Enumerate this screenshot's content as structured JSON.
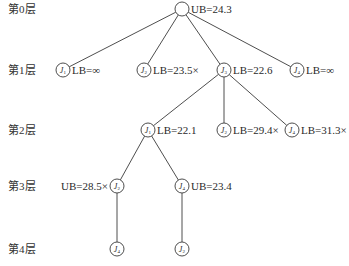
{
  "layers": [
    {
      "label": "第0层",
      "y": 9
    },
    {
      "label": "第1层",
      "y": 70
    },
    {
      "label": "第2层",
      "y": 130
    },
    {
      "label": "第3层",
      "y": 186
    },
    {
      "label": "第4层",
      "y": 249
    }
  ],
  "node_radius": 7,
  "colors": {
    "line": "#3a3a3a",
    "circle_stroke": "#3a3a3a",
    "text": "#2a2a2a",
    "background": "#ffffff"
  },
  "nodes": [
    {
      "id": "root",
      "job": "",
      "sub": "",
      "x": 182,
      "y": 9,
      "label": "UB=24.3",
      "label_side": "right",
      "pruned": false
    },
    {
      "id": "l1-j1",
      "job": "J",
      "sub": "1",
      "x": 63,
      "y": 70,
      "label": "LB=∞",
      "label_side": "right",
      "pruned": false
    },
    {
      "id": "l1-j2",
      "job": "J",
      "sub": "2",
      "x": 144,
      "y": 70,
      "label": "LB=23.5×",
      "label_side": "right",
      "pruned": true
    },
    {
      "id": "l1-j3",
      "job": "J",
      "sub": "3",
      "x": 224,
      "y": 70,
      "label": "LB=22.6",
      "label_side": "right",
      "pruned": false
    },
    {
      "id": "l1-j4",
      "job": "J",
      "sub": "4",
      "x": 297,
      "y": 70,
      "label": "LB=∞",
      "label_side": "right",
      "pruned": false
    },
    {
      "id": "l2-j1",
      "job": "J",
      "sub": "1",
      "x": 148,
      "y": 130,
      "label": "LB=22.1",
      "label_side": "right",
      "pruned": false
    },
    {
      "id": "l2-j2",
      "job": "J",
      "sub": "2",
      "x": 224,
      "y": 130,
      "label": "LB=29.4×",
      "label_side": "right",
      "pruned": true
    },
    {
      "id": "l2-j4",
      "job": "J",
      "sub": "4",
      "x": 292,
      "y": 130,
      "label": "LB=31.3×",
      "label_side": "right",
      "pruned": true
    },
    {
      "id": "l3-j2",
      "job": "J",
      "sub": "2",
      "x": 117,
      "y": 186,
      "label": "UB=28.5×",
      "label_side": "left",
      "pruned": true
    },
    {
      "id": "l3-j4",
      "job": "J",
      "sub": "4",
      "x": 182,
      "y": 186,
      "label": "UB=23.4",
      "label_side": "right",
      "pruned": false
    },
    {
      "id": "l4-j4",
      "job": "J",
      "sub": "4",
      "x": 117,
      "y": 249,
      "label": "",
      "label_side": "right",
      "pruned": false
    },
    {
      "id": "l4-j2",
      "job": "J",
      "sub": "2",
      "x": 182,
      "y": 249,
      "label": "",
      "label_side": "right",
      "pruned": false
    }
  ],
  "edges": [
    [
      "root",
      "l1-j1"
    ],
    [
      "root",
      "l1-j2"
    ],
    [
      "root",
      "l1-j3"
    ],
    [
      "root",
      "l1-j4"
    ],
    [
      "l1-j3",
      "l2-j1"
    ],
    [
      "l1-j3",
      "l2-j2"
    ],
    [
      "l1-j3",
      "l2-j4"
    ],
    [
      "l2-j1",
      "l3-j2"
    ],
    [
      "l2-j1",
      "l3-j4"
    ],
    [
      "l3-j2",
      "l4-j4"
    ],
    [
      "l3-j4",
      "l4-j2"
    ]
  ]
}
